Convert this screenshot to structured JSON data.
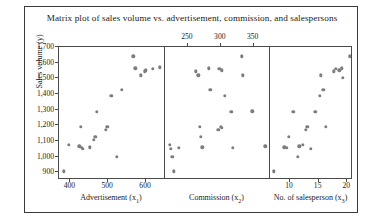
{
  "chart_data": {
    "type": "scatter",
    "title": "Matrix plot of sales volume vs. advertisement, commission, and salespersons",
    "ylabel": "Sales volume (y)",
    "ylim": [
      850,
      1700
    ],
    "yticks": [
      900,
      1000,
      1100,
      1200,
      1300,
      1400,
      1500,
      1600,
      1700
    ],
    "ytick_labels": [
      "900",
      "1,000",
      "1,100",
      "1,200",
      "1,300",
      "1,400",
      "1,500",
      "1,600",
      "1,700"
    ],
    "grid": false,
    "legend": null,
    "marker_color": "#7d7d7d",
    "panels": [
      {
        "xlabel": "Advertisement (x1)",
        "xlabel_base": "Advertisement (x",
        "xlabel_sub": "1",
        "xticks": [
          400,
          500,
          600
        ],
        "xtick_labels": [
          "400",
          "500",
          "600"
        ],
        "xtick_position": "bottom",
        "xlim": [
          370,
          650
        ],
        "points": [
          {
            "x": 382,
            "y": 905
          },
          {
            "x": 396,
            "y": 1075
          },
          {
            "x": 424,
            "y": 1065
          },
          {
            "x": 430,
            "y": 1055
          },
          {
            "x": 433,
            "y": 1050
          },
          {
            "x": 428,
            "y": 1190
          },
          {
            "x": 452,
            "y": 1060
          },
          {
            "x": 462,
            "y": 1105
          },
          {
            "x": 466,
            "y": 1125
          },
          {
            "x": 470,
            "y": 1285
          },
          {
            "x": 494,
            "y": 1170
          },
          {
            "x": 498,
            "y": 1190
          },
          {
            "x": 508,
            "y": 1390
          },
          {
            "x": 522,
            "y": 1000
          },
          {
            "x": 536,
            "y": 1425
          },
          {
            "x": 566,
            "y": 1640
          },
          {
            "x": 572,
            "y": 1565
          },
          {
            "x": 586,
            "y": 1520
          },
          {
            "x": 596,
            "y": 1545
          },
          {
            "x": 600,
            "y": 1550
          },
          {
            "x": 618,
            "y": 1560
          },
          {
            "x": 636,
            "y": 1570
          }
        ]
      },
      {
        "xlabel": "Commission (x2)",
        "xlabel_base": "Commission (x",
        "xlabel_sub": "2",
        "xticks": [
          250,
          300,
          350
        ],
        "xtick_labels": [
          "250",
          "300",
          "350"
        ],
        "xtick_position": "top",
        "xlim": [
          215,
          375
        ],
        "points": [
          {
            "x": 222,
            "y": 1075
          },
          {
            "x": 224,
            "y": 1050
          },
          {
            "x": 226,
            "y": 1000
          },
          {
            "x": 228,
            "y": 905
          },
          {
            "x": 236,
            "y": 1055
          },
          {
            "x": 262,
            "y": 1545
          },
          {
            "x": 266,
            "y": 1520
          },
          {
            "x": 268,
            "y": 1190
          },
          {
            "x": 270,
            "y": 1125
          },
          {
            "x": 272,
            "y": 1060
          },
          {
            "x": 282,
            "y": 1565
          },
          {
            "x": 284,
            "y": 1425
          },
          {
            "x": 296,
            "y": 1170
          },
          {
            "x": 298,
            "y": 1560
          },
          {
            "x": 302,
            "y": 1550
          },
          {
            "x": 300,
            "y": 1190
          },
          {
            "x": 302,
            "y": 1185
          },
          {
            "x": 306,
            "y": 1390
          },
          {
            "x": 316,
            "y": 1285
          },
          {
            "x": 318,
            "y": 1055
          },
          {
            "x": 332,
            "y": 1640
          },
          {
            "x": 334,
            "y": 1520
          },
          {
            "x": 348,
            "y": 1290
          },
          {
            "x": 368,
            "y": 1065
          }
        ]
      },
      {
        "xlabel": "No. of salesperson (x3)",
        "xlabel_base": "No. of salesperson (x",
        "xlabel_sub": "3",
        "xticks": [
          10,
          15,
          20
        ],
        "xtick_labels": [
          "10",
          "15",
          "20"
        ],
        "xtick_position": "bottom",
        "xlim": [
          6.5,
          21
        ],
        "points": [
          {
            "x": 7.2,
            "y": 905
          },
          {
            "x": 9.0,
            "y": 1060
          },
          {
            "x": 9.4,
            "y": 1055
          },
          {
            "x": 9.8,
            "y": 1125
          },
          {
            "x": 10.6,
            "y": 1285
          },
          {
            "x": 11.4,
            "y": 1000
          },
          {
            "x": 11.6,
            "y": 1065
          },
          {
            "x": 12.2,
            "y": 1075
          },
          {
            "x": 12.8,
            "y": 1170
          },
          {
            "x": 13.0,
            "y": 1190
          },
          {
            "x": 13.6,
            "y": 1050
          },
          {
            "x": 14.4,
            "y": 1285
          },
          {
            "x": 15.2,
            "y": 1390
          },
          {
            "x": 15.4,
            "y": 1520
          },
          {
            "x": 15.8,
            "y": 1425
          },
          {
            "x": 16.2,
            "y": 1190
          },
          {
            "x": 17.6,
            "y": 1545
          },
          {
            "x": 18.0,
            "y": 1560
          },
          {
            "x": 18.6,
            "y": 1550
          },
          {
            "x": 19.0,
            "y": 1565
          },
          {
            "x": 19.2,
            "y": 1505
          },
          {
            "x": 20.4,
            "y": 1640
          }
        ]
      }
    ]
  }
}
